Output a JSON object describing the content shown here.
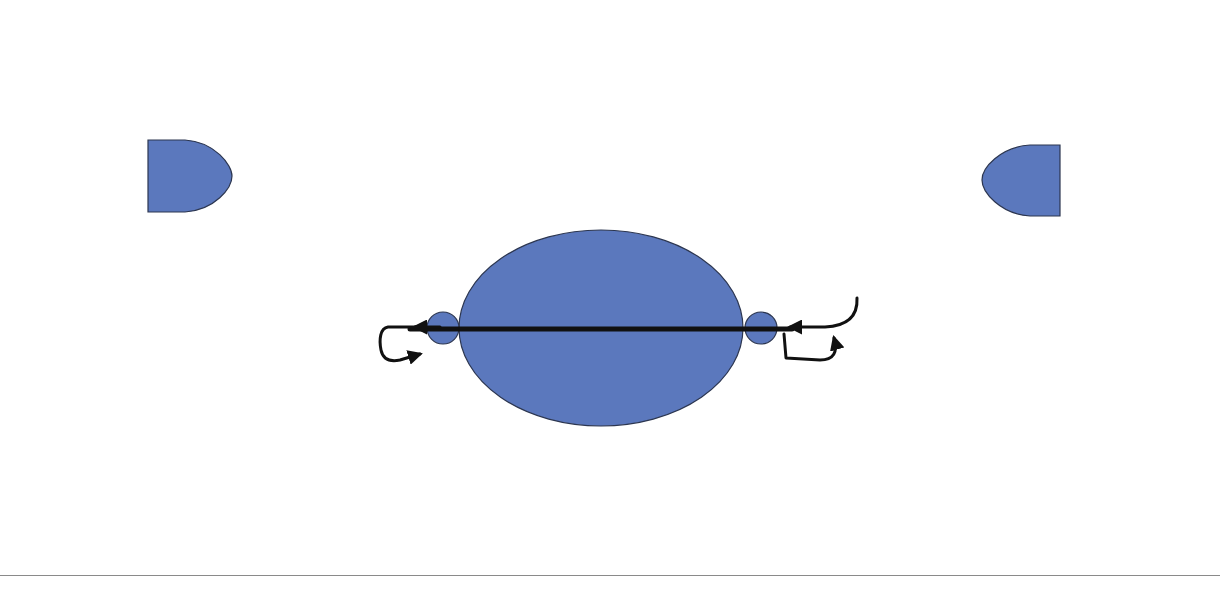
{
  "page": {
    "number": "28"
  },
  "colors": {
    "bead_fill": "#5b78bd",
    "bead_stroke": "#2c3650",
    "tube_dark": "#3a4a5a",
    "tube_light": "#f2f6f7",
    "thread": "#111111"
  },
  "figures": [
    {
      "id": "full-bracelet",
      "description": "Strand of oval beads separated by small round spacers, loop clasp on left, tube bead on right"
    },
    {
      "id": "detail-drop",
      "description": "Centerpiece oval with arc of tube beads; thread path with arrows passing through spacer and tubes"
    }
  ],
  "counts": {
    "top_oval_beads": 10,
    "arc_tube_beads_left": 9,
    "arc_tube_beads_bottom": 22,
    "arc_tube_beads_right": 9
  }
}
